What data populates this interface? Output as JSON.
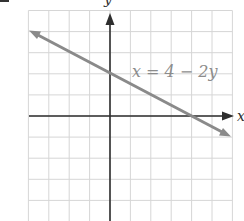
{
  "chart_data": {
    "type": "line",
    "title": "",
    "xlabel": "x",
    "ylabel": "y",
    "grid": true,
    "xlim": [
      -4,
      6
    ],
    "ylim": [
      -5,
      5
    ],
    "series": [
      {
        "name": "x = 4 - 2y",
        "equation": "x = 4 - 2y",
        "x": [
          -4,
          0,
          4,
          6
        ],
        "y": [
          4,
          2,
          0,
          -1
        ],
        "x_intercept": 4,
        "y_intercept": 2,
        "color": "#8a8a8a",
        "arrows": "both"
      }
    ],
    "annotations": [
      {
        "text": "x = 4 − 2y",
        "x": 3,
        "y": 2
      }
    ]
  },
  "labels": {
    "x_axis": "x",
    "y_axis": "y",
    "equation": "x = 4 − 2y"
  },
  "colors": {
    "grid": "#d6d6d6",
    "axis": "#2e2e2e",
    "line": "#8a8a8a",
    "label": "#8c8c8c"
  }
}
